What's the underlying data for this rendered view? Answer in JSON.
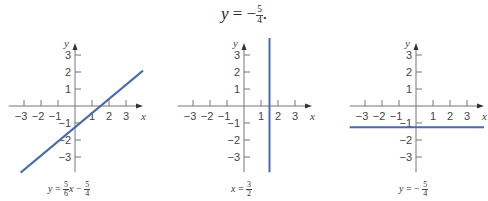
{
  "title": {
    "lhs": "y",
    "eq": "=",
    "sign": "−",
    "num": "5",
    "den": "4",
    "trail": "."
  },
  "chart_data": [
    {
      "type": "line",
      "title": "",
      "caption": {
        "lhs": "y",
        "eq": "=",
        "coef_num": "5",
        "coef_den": "6",
        "var": "x",
        "op": "−",
        "c_num": "5",
        "c_den": "4"
      },
      "equation": "y = (5/6)x - 5/4",
      "xlabel": "x",
      "ylabel": "y",
      "xlim": [
        -3.9,
        4.0
      ],
      "ylim": [
        -3.9,
        3.7
      ],
      "xticks": [
        -3,
        -2,
        -1,
        1,
        2,
        3
      ],
      "yticks": [
        -3,
        -2,
        -1,
        1,
        2,
        3
      ],
      "grid": false,
      "series": [
        {
          "name": "y = 5/6 x - 5/4",
          "color": "#4a6bb0",
          "x": [
            -3.2,
            4.0
          ],
          "y": [
            -3.92,
            2.08
          ]
        }
      ]
    },
    {
      "type": "line",
      "title": "",
      "caption": {
        "lhs": "x",
        "eq": "=",
        "num": "3",
        "den": "2"
      },
      "equation": "x = 3/2",
      "xlabel": "x",
      "ylabel": "y",
      "xlim": [
        -3.9,
        4.0
      ],
      "ylim": [
        -3.9,
        4.0
      ],
      "xticks": [
        -3,
        -2,
        -1,
        1,
        2,
        3
      ],
      "yticks": [
        -3,
        -2,
        -1,
        1,
        2,
        3
      ],
      "grid": false,
      "series": [
        {
          "name": "x = 3/2",
          "color": "#4a6bb0",
          "x": [
            1.5,
            1.5
          ],
          "y": [
            -3.9,
            4.0
          ]
        }
      ]
    },
    {
      "type": "line",
      "title": "",
      "caption": {
        "lhs": "y",
        "eq": "=",
        "sign": "−",
        "num": "5",
        "den": "4"
      },
      "equation": "y = -5/4",
      "xlabel": "x",
      "ylabel": "y",
      "xlim": [
        -3.9,
        4.0
      ],
      "ylim": [
        -3.9,
        3.7
      ],
      "xticks": [
        -3,
        -2,
        -1,
        1,
        2,
        3
      ],
      "yticks": [
        -3,
        -2,
        -1,
        1,
        2,
        3
      ],
      "grid": false,
      "series": [
        {
          "name": "y = -5/4",
          "color": "#4a6bb0",
          "x": [
            -3.9,
            4.0
          ],
          "y": [
            -1.25,
            -1.25
          ]
        }
      ]
    }
  ],
  "colors": {
    "axis": "#777777",
    "line": "#4a6bb0",
    "text": "#444444"
  }
}
